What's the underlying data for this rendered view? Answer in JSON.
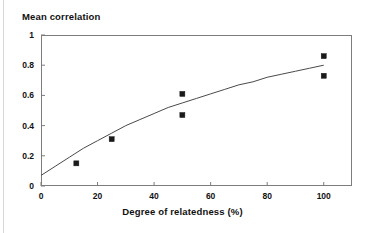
{
  "chart_data": {
    "type": "scatter",
    "title": "Mean correlation",
    "xlabel": "Degree of relatedness (%)",
    "ylabel": "Mean correlation",
    "xlim": [
      0,
      110
    ],
    "ylim": [
      0,
      1
    ],
    "grid": false,
    "legend": "none",
    "xticks": [
      "0",
      "20",
      "40",
      "60",
      "80",
      "100"
    ],
    "xtick_values": [
      0,
      20,
      40,
      60,
      80,
      100
    ],
    "yticks": [
      "0",
      "0.2",
      "0.4",
      "0.6",
      "0.8",
      "1"
    ],
    "ytick_values": [
      0,
      0.2,
      0.4,
      0.6,
      0.8,
      1
    ],
    "series": [
      {
        "name": "Observed mean correlation",
        "type": "scatter",
        "marker": "square",
        "color": "#1a1a1a",
        "points": [
          {
            "x": 12.5,
            "y": 0.15
          },
          {
            "x": 25,
            "y": 0.31
          },
          {
            "x": 50,
            "y": 0.61
          },
          {
            "x": 50,
            "y": 0.47
          },
          {
            "x": 100,
            "y": 0.86
          },
          {
            "x": 100,
            "y": 0.73
          }
        ]
      },
      {
        "name": "Fitted curve",
        "type": "line",
        "color": "#4a4a4a",
        "points": [
          {
            "x": 0,
            "y": 0.07
          },
          {
            "x": 5,
            "y": 0.13
          },
          {
            "x": 10,
            "y": 0.19
          },
          {
            "x": 15,
            "y": 0.25
          },
          {
            "x": 20,
            "y": 0.3
          },
          {
            "x": 25,
            "y": 0.35
          },
          {
            "x": 30,
            "y": 0.4
          },
          {
            "x": 35,
            "y": 0.44
          },
          {
            "x": 40,
            "y": 0.48
          },
          {
            "x": 45,
            "y": 0.52
          },
          {
            "x": 50,
            "y": 0.55
          },
          {
            "x": 55,
            "y": 0.58
          },
          {
            "x": 60,
            "y": 0.61
          },
          {
            "x": 65,
            "y": 0.64
          },
          {
            "x": 70,
            "y": 0.67
          },
          {
            "x": 75,
            "y": 0.69
          },
          {
            "x": 80,
            "y": 0.72
          },
          {
            "x": 85,
            "y": 0.74
          },
          {
            "x": 90,
            "y": 0.76
          },
          {
            "x": 95,
            "y": 0.78
          },
          {
            "x": 100,
            "y": 0.8
          }
        ]
      }
    ]
  },
  "figure": {
    "title": "Mean correlation",
    "xaxis_title": "Degree of relatedness (%)"
  }
}
